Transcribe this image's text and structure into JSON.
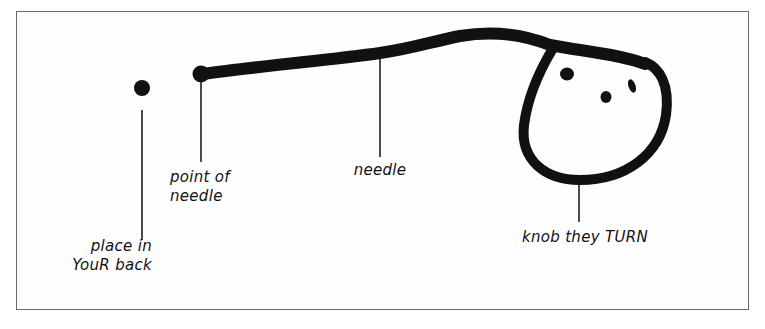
{
  "diagram": {
    "type": "hand-drawn labeled sketch",
    "colors": {
      "ink": "#111111",
      "frame": "#6a6a6a",
      "background": "#ffffff"
    },
    "labels": {
      "place_in_your_back": {
        "line1": "place in",
        "line2": "YouR back"
      },
      "point_of_needle": {
        "line1": "point of",
        "line2": "needle"
      },
      "needle": "needle",
      "knob": "knob they TURN"
    },
    "parts": [
      {
        "id": "target-dot",
        "label": "place in YouR back"
      },
      {
        "id": "needle-point",
        "label": "point of needle"
      },
      {
        "id": "needle-shaft",
        "label": "needle"
      },
      {
        "id": "knob",
        "label": "knob they TURN"
      }
    ]
  }
}
